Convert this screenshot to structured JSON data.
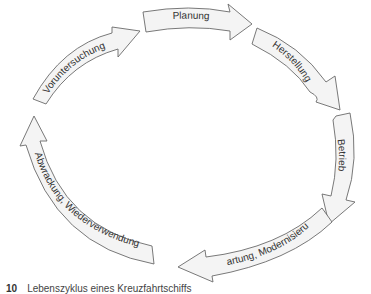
{
  "diagram": {
    "type": "cycle",
    "title": "Lebenszyklus eines Kreuzfahrtschiffs",
    "stages": [
      {
        "label": "Planung"
      },
      {
        "label": "Herstellung"
      },
      {
        "label": "Betrieb"
      },
      {
        "label": "Wartung, Modernisierung"
      },
      {
        "label": "Abwrackung, Wiederverwendung"
      },
      {
        "label": "Voruntersuchung"
      }
    ]
  },
  "caption": {
    "number": "10",
    "text": "Lebenszyklus eines Kreuzfahrtschiffs"
  }
}
